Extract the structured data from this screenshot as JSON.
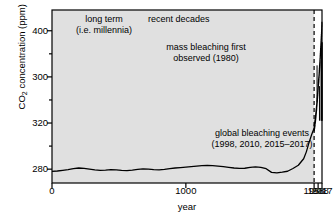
{
  "chart_data": {
    "type": "line",
    "title": "",
    "xlabel": "year",
    "ylabel": "CO2 concentration (ppm)",
    "ylabel_parts": {
      "pre": "CO",
      "sub": "2",
      "post": " concentration (ppm)"
    },
    "grid": false,
    "legend": "none",
    "xlim": [
      0,
      2017
    ],
    "ylim": [
      268,
      418
    ],
    "xticks": [
      {
        "value": 0,
        "label": "0"
      },
      {
        "value": 1000,
        "label": "1000"
      },
      {
        "value": 1958,
        "label": "1958"
      },
      {
        "value": 1988,
        "label": "1988"
      },
      {
        "value": 2017,
        "label": "2017"
      }
    ],
    "yticks_major": [
      {
        "value": 280,
        "label": "280"
      },
      {
        "value": 320,
        "label": "320"
      },
      {
        "value": 360,
        "label": "300"
      },
      {
        "value": 400,
        "label": "400"
      }
    ],
    "yticks_minor": [
      300,
      340,
      380
    ],
    "shaded_region": {
      "x_from": 0,
      "x_to": 1958,
      "color": "#e0e0e0",
      "label": "long term"
    },
    "divider_line": {
      "x": 1958,
      "style": "dashed"
    },
    "series": [
      {
        "name": "ice-core CO2 (long term)",
        "x": [
          0,
          40,
          80,
          120,
          160,
          200,
          240,
          280,
          320,
          360,
          400,
          440,
          480,
          520,
          560,
          600,
          640,
          680,
          720,
          760,
          800,
          840,
          880,
          920,
          960,
          1000,
          1040,
          1080,
          1120,
          1160,
          1200,
          1240,
          1280,
          1320,
          1360,
          1400,
          1440,
          1480,
          1520,
          1560,
          1600,
          1640,
          1680,
          1720,
          1760,
          1800,
          1840,
          1880,
          1900,
          1920,
          1940,
          1958
        ],
        "y": [
          278.0,
          278.4,
          279.0,
          279.6,
          280.4,
          281.0,
          280.6,
          280.0,
          279.4,
          279.0,
          279.2,
          279.6,
          279.4,
          279.0,
          278.8,
          279.2,
          279.8,
          280.2,
          280.0,
          279.6,
          279.4,
          279.8,
          280.4,
          281.0,
          281.4,
          281.8,
          282.2,
          282.6,
          283.0,
          283.2,
          283.0,
          282.6,
          282.2,
          281.6,
          281.0,
          280.6,
          280.8,
          281.6,
          282.0,
          281.6,
          280.4,
          277.2,
          276.8,
          277.4,
          278.2,
          280.6,
          283.4,
          289.0,
          295.0,
          303.0,
          310.0,
          315.5
        ]
      },
      {
        "name": "Mauna Loa CO2 (recent decades, with seasonal cycle)",
        "x": [
          1958,
          1962,
          1966,
          1970,
          1974,
          1978,
          1982,
          1986,
          1990,
          1994,
          1998,
          2002,
          2006,
          2010,
          2014,
          2017
        ],
        "y": [
          315.0,
          318.0,
          321.0,
          325.5,
          330.0,
          335.0,
          341.0,
          347.0,
          354.0,
          358.5,
          366.5,
          373.0,
          381.5,
          389.5,
          398.0,
          407.0
        ],
        "seasonal_amplitude": 3.0
      }
    ],
    "event_markers": [
      {
        "label": "mass bleaching first observed",
        "year": 1980,
        "y_top": 370,
        "y_bottom": 338
      },
      {
        "label": "global bleaching event",
        "year": 1998,
        "y_top": 352,
        "y_bottom": 322
      },
      {
        "label": "global bleaching event",
        "year": 2010,
        "y_top": 374,
        "y_bottom": 322
      },
      {
        "label": "global bleaching event",
        "year": 2015,
        "y_top": 390,
        "y_bottom": 322
      },
      {
        "label": "global bleaching event",
        "year": 2016,
        "y_top": 390,
        "y_bottom": 322
      },
      {
        "label": "global bleaching event",
        "year": 2017,
        "y_top": 390,
        "y_bottom": 322
      }
    ],
    "annotations": [
      {
        "id": "long_term",
        "line1": "long term",
        "line2": "(i.e. millennia)"
      },
      {
        "id": "recent_decades",
        "line1": "recent decades",
        "line2": ""
      },
      {
        "id": "mass_bleaching",
        "line1": "mass bleaching first",
        "line2": "observed (1980)"
      },
      {
        "id": "global_events",
        "line1": "global bleaching events",
        "line2": "(1998, 2010, 2015–2017)"
      }
    ],
    "colors": {
      "line": "#000000",
      "axis": "#000000",
      "shade": "#e0e0e0",
      "background": "#ffffff"
    }
  }
}
